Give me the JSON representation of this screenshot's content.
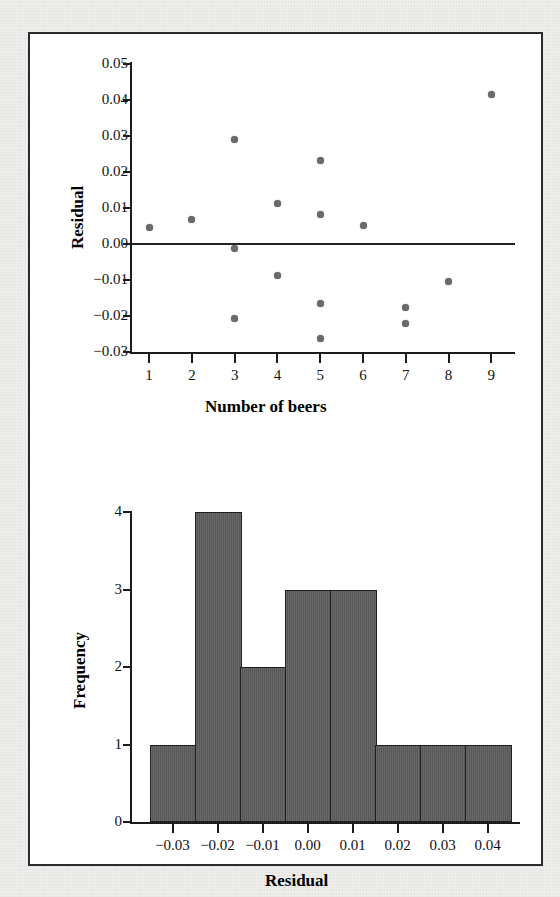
{
  "figure": {
    "background_color": "#efeeec",
    "panel_color": "#ffffff",
    "border_color": "#2b2b2b",
    "marker_color": "#6a6a6a",
    "bar_fill_color": "#5d5d5d",
    "bar_edge_color": "#1f1f1f"
  },
  "chart_data": [
    {
      "type": "scatter",
      "title": "",
      "xlabel": "Number of beers",
      "ylabel": "Residual",
      "xlim": [
        0.6,
        9.6
      ],
      "ylim": [
        -0.03,
        0.05
      ],
      "grid": false,
      "legend": null,
      "reference_line": {
        "orientation": "horizontal",
        "value": 0.0
      },
      "xticks": [
        1,
        2,
        3,
        4,
        5,
        6,
        7,
        8,
        9
      ],
      "xtick_labels": [
        "1",
        "2",
        "3",
        "4",
        "5",
        "6",
        "7",
        "8",
        "9"
      ],
      "yticks": [
        -0.03,
        -0.02,
        -0.01,
        0.0,
        0.01,
        0.02,
        0.03,
        0.04,
        0.05
      ],
      "ytick_labels": [
        "−0.03",
        "−0.02",
        "−0.01",
        "0.00",
        "0.01",
        "0.02",
        "0.03",
        "0.04",
        "0.05"
      ],
      "x": [
        1,
        2,
        3,
        3,
        3,
        4,
        4,
        5,
        5,
        5,
        5,
        6,
        7,
        7,
        8,
        9
      ],
      "y": [
        0.0045,
        0.0068,
        0.029,
        -0.0012,
        -0.0208,
        0.0112,
        -0.0088,
        0.0233,
        0.0082,
        -0.0165,
        -0.0262,
        0.0051,
        -0.0175,
        -0.0222,
        -0.0104,
        0.0415
      ],
      "n_points": 16
    },
    {
      "type": "bar",
      "title": "",
      "xlabel": "Residual",
      "ylabel": "Frequency",
      "ylim": [
        0,
        4
      ],
      "grid": false,
      "legend": null,
      "bin_width": 0.01,
      "categories": [
        "−0.03",
        "−0.02",
        "−0.01",
        "0.00",
        "0.01",
        "0.02",
        "0.03",
        "0.04"
      ],
      "bin_centers": [
        -0.03,
        -0.02,
        -0.01,
        0.0,
        0.01,
        0.02,
        0.03,
        0.04
      ],
      "values": [
        1,
        4,
        2,
        3,
        3,
        1,
        1,
        1
      ],
      "total_count": 16,
      "xticks": [
        -0.03,
        -0.02,
        -0.01,
        0.0,
        0.01,
        0.02,
        0.03,
        0.04
      ],
      "xtick_labels": [
        "−0.03",
        "−0.02",
        "−0.01",
        "0.00",
        "0.01",
        "0.02",
        "0.03",
        "0.04"
      ],
      "yticks": [
        0,
        1,
        2,
        3,
        4
      ],
      "ytick_labels": [
        "0",
        "1",
        "2",
        "3",
        "4"
      ]
    }
  ]
}
